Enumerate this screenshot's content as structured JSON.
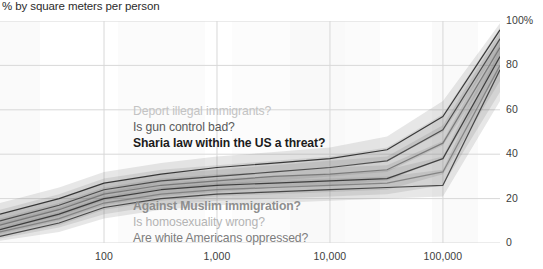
{
  "chart_data": {
    "type": "line",
    "title": "% by square meters per person",
    "xlabel": "",
    "ylabel": "",
    "xscale": "log",
    "xlim": [
      12,
      320000
    ],
    "ylim": [
      0,
      100
    ],
    "grid": true,
    "legend_position": "inline-annotations",
    "x_ticks": [
      "100",
      "1,000",
      "10,000",
      "100,000"
    ],
    "x_tick_values": [
      100,
      1000,
      10000,
      100000
    ],
    "y_ticks": [
      "0",
      "20",
      "40",
      "60",
      "80",
      "100%"
    ],
    "y_tick_values": [
      0,
      20,
      40,
      60,
      80,
      100
    ],
    "x": [
      12,
      40,
      100,
      320,
      1000,
      3200,
      10000,
      32000,
      100000,
      320000
    ],
    "series": [
      {
        "name": "Sharia law within the US a threat?",
        "shade": "#1d1d1d",
        "values": [
          13,
          20,
          27,
          31,
          34,
          36,
          38,
          42,
          57,
          96
        ],
        "band_low": [
          8,
          15,
          22,
          27,
          30,
          32,
          34,
          37,
          50,
          88
        ],
        "band_high": [
          18,
          25,
          32,
          36,
          39,
          41,
          43,
          48,
          64,
          99
        ]
      },
      {
        "name": "Is gun control bad?",
        "shade": "#3a3a3a",
        "values": [
          10,
          17,
          24,
          28,
          30,
          32,
          34,
          37,
          51,
          92
        ],
        "band_low": [
          6,
          12,
          19,
          24,
          26,
          28,
          30,
          32,
          44,
          83
        ],
        "band_high": [
          15,
          22,
          29,
          33,
          35,
          37,
          39,
          43,
          58,
          97
        ]
      },
      {
        "name": "Deport illegal immigrants?",
        "shade": "#6e6e6e",
        "values": [
          8,
          15,
          22,
          26,
          28,
          30,
          31,
          33,
          45,
          88
        ],
        "band_low": [
          4,
          10,
          17,
          21,
          23,
          25,
          26,
          28,
          38,
          78
        ],
        "band_high": [
          13,
          20,
          27,
          31,
          33,
          35,
          37,
          39,
          53,
          95
        ]
      },
      {
        "name": "Against Muslim immigration?",
        "shade": "#2a2a2a",
        "values": [
          6,
          13,
          20,
          24,
          26,
          27,
          28,
          29,
          38,
          84
        ],
        "band_low": [
          3,
          8,
          15,
          19,
          21,
          22,
          23,
          24,
          31,
          73
        ],
        "band_high": [
          11,
          18,
          25,
          29,
          31,
          32,
          34,
          35,
          46,
          93
        ]
      },
      {
        "name": "Is homosexuality wrong?",
        "shade": "#7a7a7a",
        "values": [
          5,
          11,
          18,
          22,
          24,
          25,
          26,
          27,
          32,
          80
        ],
        "band_low": [
          2,
          7,
          13,
          17,
          19,
          20,
          21,
          22,
          26,
          68
        ],
        "band_high": [
          9,
          16,
          23,
          27,
          29,
          30,
          31,
          33,
          39,
          90
        ]
      },
      {
        "name": "Are white Americans oppressed?",
        "shade": "#333333",
        "values": [
          3,
          9,
          16,
          20,
          22,
          23,
          24,
          25,
          26,
          78
        ],
        "band_low": [
          1,
          5,
          11,
          15,
          17,
          18,
          19,
          20,
          21,
          64
        ],
        "band_high": [
          7,
          14,
          21,
          25,
          27,
          28,
          29,
          30,
          33,
          88
        ]
      }
    ],
    "annotations_upper": [
      {
        "text": "Deport illegal immigrants?",
        "color": "#c3c3c3",
        "weight": "400"
      },
      {
        "text": "Is gun control bad?",
        "color": "#5a5a5a",
        "weight": "400"
      },
      {
        "text": "Sharia law within the US a threat?",
        "color": "#1c1c1c",
        "weight": "700"
      }
    ],
    "annotations_lower": [
      {
        "text": "Against Muslim immigration?",
        "color": "#8e8e8e",
        "weight": "700"
      },
      {
        "text": "Is homosexuality wrong?",
        "color": "#b4b4b4",
        "weight": "400"
      },
      {
        "text": "Are white Americans oppressed?",
        "color": "#7d7d7d",
        "weight": "400"
      }
    ],
    "density_bands": [
      {
        "x_start": 0,
        "x_end": 40,
        "opacity": 0.05
      },
      {
        "x_start": 118,
        "x_end": 205,
        "opacity": 0.045
      },
      {
        "x_start": 232,
        "x_end": 290,
        "opacity": 0.03
      },
      {
        "x_start": 290,
        "x_end": 345,
        "opacity": 0.055
      },
      {
        "x_start": 345,
        "x_end": 380,
        "opacity": 0.035
      },
      {
        "x_start": 432,
        "x_end": 478,
        "opacity": 0.05
      }
    ],
    "colors": {
      "grid": "#d8d8d8",
      "band_fill": "#6f6f6f",
      "text": "#3c3c3c",
      "title": "#2b2b2b"
    }
  }
}
